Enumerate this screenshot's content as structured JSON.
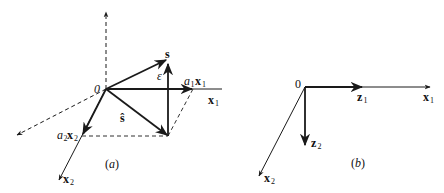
{
  "figure": {
    "panel_a": {
      "caption": "(a)",
      "caption_letter": "a",
      "origin_label": "0",
      "labels": {
        "s": "s",
        "s_hat": "ŝ",
        "epsilon": "ε",
        "a1x1_coef": "a",
        "a1x1_coef_sub": "1",
        "a1x1_vec": "x",
        "a1x1_vec_sub": "1",
        "a2x2_coef": "a",
        "a2x2_coef_sub": "2",
        "a2x2_vec": "x",
        "a2x2_vec_sub": "2",
        "x1": "x",
        "x1_sub": "1",
        "x2": "x",
        "x2_sub": "2"
      }
    },
    "panel_b": {
      "caption": "(b)",
      "caption_letter": "b",
      "origin_label": "0",
      "labels": {
        "z1": "z",
        "z1_sub": "1",
        "z2": "z",
        "z2_sub": "2",
        "x1": "x",
        "x1_sub": "1",
        "x2": "x",
        "x2_sub": "2"
      }
    },
    "colors": {
      "line": "#1a1a1a",
      "background": "#ffffff"
    }
  }
}
